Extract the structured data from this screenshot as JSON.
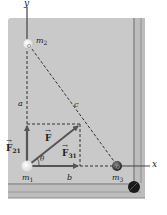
{
  "figure": {
    "type": "physics-diagram",
    "scene": "billiard table with three balls and force vectors",
    "colors": {
      "table": "#c9c9c9",
      "rail": "#bdbdbd",
      "rail_stripe": "#8a8a8a",
      "vector": "#555555",
      "dashed": "#333333",
      "ball_m1": "#f4f4f4",
      "ball_m2": "#e8e8e8",
      "ball_m3": "#3a3a3a",
      "pocket": "#1a1a1a"
    },
    "axes": {
      "x_label": "x",
      "y_label": "y"
    },
    "masses": {
      "m1": {
        "label": "m",
        "sub": "1"
      },
      "m2": {
        "label": "m",
        "sub": "2"
      },
      "m3": {
        "label": "m",
        "sub": "3"
      }
    },
    "distances": {
      "a": "a",
      "b": "b",
      "c": "c"
    },
    "forces": {
      "F": {
        "label": "F",
        "sub": ""
      },
      "F21": {
        "label": "F",
        "sub": "21"
      },
      "F31": {
        "label": "F",
        "sub": "31"
      }
    },
    "angle": "θ"
  }
}
